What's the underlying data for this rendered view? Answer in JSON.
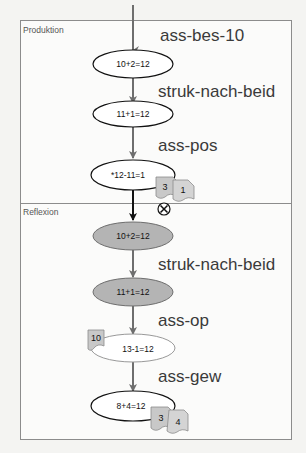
{
  "sections": [
    {
      "label": "Produktion"
    },
    {
      "label": "Reflexion"
    }
  ],
  "nodes": [
    {
      "text": "10+2=12",
      "style": "outline"
    },
    {
      "text": "11+1=12",
      "style": "outline"
    },
    {
      "text": "*12-11=1",
      "style": "outline"
    },
    {
      "text": "10+2=12",
      "style": "filled"
    },
    {
      "text": "11+1=12",
      "style": "filled"
    },
    {
      "text": "13-1=12",
      "style": "light"
    },
    {
      "text": "8+4=12",
      "style": "outline"
    }
  ],
  "rules": [
    {
      "label": "ass-bes-10"
    },
    {
      "label": "struk-nach-beid"
    },
    {
      "label": "ass-pos"
    },
    {
      "label": "struk-nach-beid"
    },
    {
      "label": "ass-op"
    },
    {
      "label": "ass-gew"
    }
  ],
  "badges": [
    {
      "text": "3",
      "attached_to": "*12-11=1"
    },
    {
      "text": "1",
      "attached_to": "*12-11=1"
    },
    {
      "text": "10",
      "attached_to": "13-1=12"
    },
    {
      "text": "3",
      "attached_to": "8+4=12"
    },
    {
      "text": "4",
      "attached_to": "8+4=12"
    }
  ],
  "error_marker": {
    "symbol": "X",
    "icon": "circled-x-icon"
  },
  "colors": {
    "arrow": "#6e6e6e",
    "arrow_boundary": "#111111",
    "filled_node": "#b4b4b4",
    "badge_fill": "#c8c8c8",
    "frame": "#8c8c8c"
  }
}
